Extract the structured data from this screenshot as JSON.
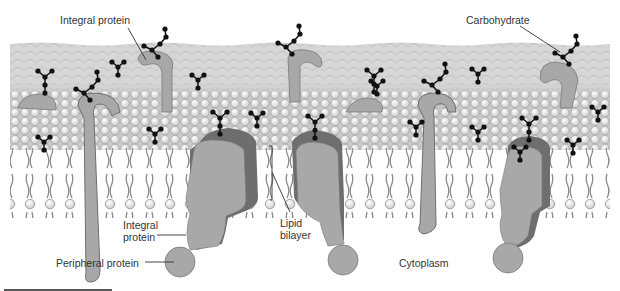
{
  "diagram": {
    "labels": {
      "integral_protein_top": "Integral protein",
      "carbohydrate": "Carbohydrate",
      "integral_protein_bottom_line1": "Integral",
      "integral_protein_bottom_line2": "protein",
      "peripheral_protein": "Peripheral protein",
      "lipid_bilayer_line1": "Lipid",
      "lipid_bilayer_line2": "bilayer",
      "cytoplasm": "Cytoplasm"
    },
    "colors": {
      "background": "#ffffff",
      "glycocalyx": "#d4d4d4",
      "phospholipid_head": "#e6e6e6",
      "phospholipid_outline": "#9a9a9a",
      "protein_fill": "#a8a8a8",
      "protein_shadow": "#6e6e6e",
      "carbohydrate_bead": "#111111",
      "label_text": "#333333",
      "leader_line": "#333333"
    },
    "components": [
      "Integral protein",
      "Carbohydrate",
      "Peripheral protein",
      "Lipid bilayer",
      "Cytoplasm"
    ]
  }
}
